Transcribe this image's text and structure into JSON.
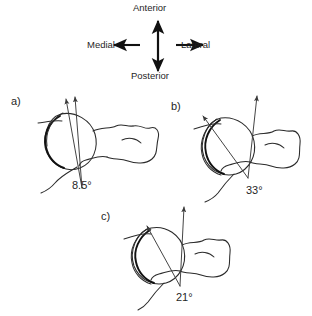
{
  "figure": {
    "type": "anatomical-line-drawing",
    "background_color": "#ffffff",
    "stroke_color": "#2b2b2b"
  },
  "compass": {
    "name": "orientation-compass",
    "anterior": "Anterior",
    "posterior": "Posterior",
    "medial": "Medial",
    "lateral": "Lateral",
    "center_x": 158,
    "center_y": 45
  },
  "panels": [
    {
      "id": "a",
      "letter": "a)",
      "angle_label": "8.5°",
      "angle_value": 8.5,
      "letter_x": 11,
      "letter_y": 96,
      "angle_x": 72,
      "angle_y": 180
    },
    {
      "id": "b",
      "letter": "b)",
      "angle_label": "33°",
      "angle_value": 33,
      "letter_x": 171,
      "letter_y": 101,
      "angle_x": 246,
      "angle_y": 185
    },
    {
      "id": "c",
      "letter": "c)",
      "angle_label": "21°",
      "angle_value": 21,
      "letter_x": 101,
      "letter_y": 211,
      "angle_x": 176,
      "angle_y": 292
    }
  ]
}
